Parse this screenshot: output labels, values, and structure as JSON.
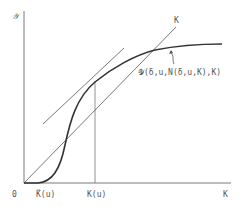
{
  "diagram": {
    "axes": {
      "y_label": "𝒴",
      "origin_label": "0",
      "x_label": "K"
    },
    "x_ticks": [
      {
        "label": "K̃(u)"
      },
      {
        "label": "K(u)"
      }
    ],
    "ray_label": "K",
    "curve_label": "𝒴(δ,u,N(δ,u,K),K)",
    "colors": {
      "axis": "#7a7a7a",
      "curve": "#333333",
      "line": "#555555",
      "text": "#555555"
    }
  }
}
